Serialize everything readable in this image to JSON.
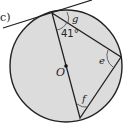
{
  "figure": {
    "part_label": "c)",
    "center_label": "O",
    "angle_given": "41°",
    "unknown_angles": [
      "g",
      "e",
      "f"
    ],
    "colors": {
      "circle_fill": "#dcdcdc",
      "stroke": "#222222"
    }
  }
}
